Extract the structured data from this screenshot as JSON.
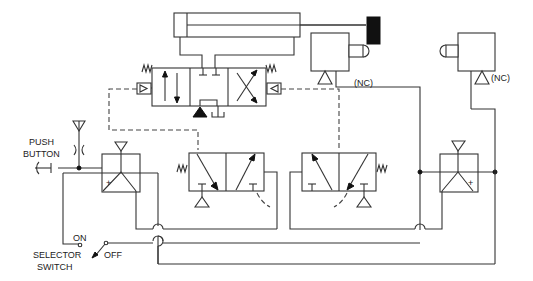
{
  "diagram": {
    "type": "pneumatic circuit schematic",
    "labels": {
      "push_button_line1": "PUSH",
      "push_button_line2": "BUTTON",
      "selector_switch_line1": "SELECTOR",
      "selector_switch_line2": "SWITCH",
      "on": "ON",
      "off": "OFF",
      "limit_valve_1_state": "(NC)",
      "limit_valve_2_state": "(NC)",
      "plus_left": "+",
      "plus_right": "+"
    },
    "components": [
      {
        "id": "cylinder",
        "label": "double-acting cylinder"
      },
      {
        "id": "main-valve",
        "label": "4-way 3-position pilot operated valve"
      },
      {
        "id": "limit-valve-1",
        "label": "normally closed limit valve, roller actuated (NC)"
      },
      {
        "id": "limit-valve-2",
        "label": "normally closed limit valve, roller actuated (NC)"
      },
      {
        "id": "push-button",
        "label": "push button with restrictor"
      },
      {
        "id": "and-valve-left",
        "label": "shuttle / relay valve (+)"
      },
      {
        "id": "and-valve-right",
        "label": "shuttle / relay valve (+)"
      },
      {
        "id": "pilot-valve-left",
        "label": "3-way 2-position pilot valve, spring return"
      },
      {
        "id": "pilot-valve-right",
        "label": "3-way 2-position pilot valve, spring return"
      },
      {
        "id": "selector-switch",
        "label": "ON/OFF selector switch"
      }
    ],
    "colors": {
      "line": "#333333",
      "background": "#ffffff",
      "fill": "#111111"
    }
  }
}
